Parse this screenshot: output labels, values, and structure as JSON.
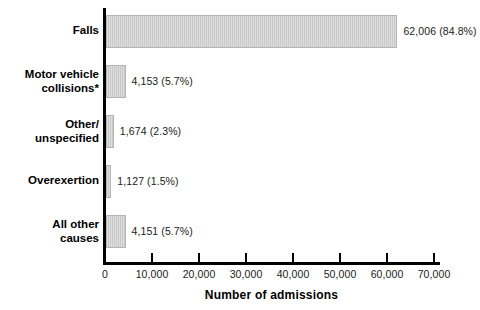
{
  "chart_data": {
    "type": "bar",
    "orientation": "horizontal",
    "title": "",
    "xlabel": "Number of admissions",
    "ylabel": "",
    "xlim": [
      0,
      74000
    ],
    "grid": false,
    "legend": null,
    "categories": [
      "Falls",
      "Motor vehicle\ncollisions*",
      "Other/\nunspecified",
      "Overexertion",
      "All other\ncauses"
    ],
    "values": [
      62006,
      4153,
      1674,
      1127,
      4151
    ],
    "percentages": [
      "84.8%",
      "5.7%",
      "2.3%",
      "1.5%",
      "5.7%"
    ],
    "data_labels": [
      "62,006 (84.8%)",
      "4,153 (5.7%)",
      "1,674 (2.3%)",
      "1,127 (1.5%)",
      "4,151 (5.7%)"
    ],
    "xticks": [
      0,
      10000,
      20000,
      30000,
      40000,
      50000,
      60000,
      70000
    ],
    "xticklabels": [
      "0",
      "10,000",
      "20,000",
      "30,000",
      "40,000",
      "50,000",
      "60,000",
      "70,000"
    ],
    "bar_color": "#c9c9c9",
    "bar_edge_color": "#b4b4b4",
    "axis_color": "#000000",
    "text_color": "#1b1b1b",
    "background": "#ffffff"
  }
}
